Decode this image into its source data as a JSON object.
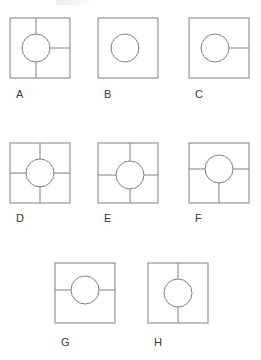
{
  "page": {
    "background_color": "#ffffff",
    "stroke_color": "#808080",
    "label_color": "#3a3a3a",
    "width": 261,
    "height": 360
  },
  "figures": [
    {
      "id": "A",
      "label": "A",
      "square": {
        "x": 10,
        "y": 18,
        "size": 60
      },
      "circle": {
        "cx": 36,
        "cy": 48,
        "r": 14
      },
      "lines": [
        "up",
        "down",
        "right"
      ],
      "line_count": 3,
      "label_pos": {
        "x": 16,
        "y": 88
      }
    },
    {
      "id": "B",
      "label": "B",
      "square": {
        "x": 98,
        "y": 18,
        "size": 60
      },
      "circle": {
        "cx": 125,
        "cy": 48,
        "r": 14
      },
      "lines": [],
      "line_count": 0,
      "label_pos": {
        "x": 104,
        "y": 88
      }
    },
    {
      "id": "C",
      "label": "C",
      "square": {
        "x": 189,
        "y": 18,
        "size": 60
      },
      "circle": {
        "cx": 215,
        "cy": 48,
        "r": 14
      },
      "lines": [
        "right"
      ],
      "line_count": 1,
      "label_pos": {
        "x": 195,
        "y": 88
      }
    },
    {
      "id": "D",
      "label": "D",
      "square": {
        "x": 10,
        "y": 143,
        "size": 60
      },
      "circle": {
        "cx": 40,
        "cy": 173,
        "r": 14
      },
      "lines": [
        "up",
        "down",
        "left",
        "right"
      ],
      "line_count": 4,
      "label_pos": {
        "x": 16,
        "y": 212
      }
    },
    {
      "id": "E",
      "label": "E",
      "square": {
        "x": 98,
        "y": 143,
        "size": 60
      },
      "circle": {
        "cx": 130,
        "cy": 175,
        "r": 14
      },
      "lines": [
        "up",
        "down",
        "left",
        "right"
      ],
      "line_count": 4,
      "label_pos": {
        "x": 104,
        "y": 212
      }
    },
    {
      "id": "F",
      "label": "F",
      "square": {
        "x": 189,
        "y": 143,
        "size": 60
      },
      "circle": {
        "cx": 219,
        "cy": 169,
        "r": 14
      },
      "lines": [
        "left",
        "right",
        "down"
      ],
      "line_count": 3,
      "label_pos": {
        "x": 195,
        "y": 212
      }
    },
    {
      "id": "G",
      "label": "G",
      "square": {
        "x": 55,
        "y": 263,
        "size": 60
      },
      "circle": {
        "cx": 85,
        "cy": 290,
        "r": 14
      },
      "lines": [
        "left",
        "right"
      ],
      "line_count": 2,
      "label_pos": {
        "x": 61,
        "y": 336
      }
    },
    {
      "id": "H",
      "label": "H",
      "square": {
        "x": 148,
        "y": 263,
        "size": 60
      },
      "circle": {
        "cx": 178,
        "cy": 293,
        "r": 14
      },
      "lines": [
        "up",
        "down"
      ],
      "line_count": 2,
      "label_pos": {
        "x": 154,
        "y": 336
      }
    }
  ]
}
